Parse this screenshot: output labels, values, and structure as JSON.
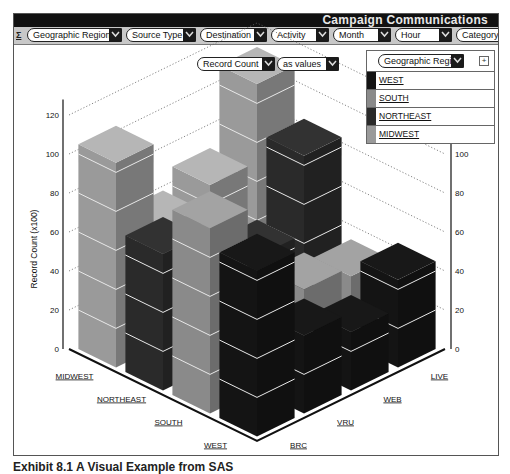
{
  "window": {
    "title": "Campaign Communications"
  },
  "toolbar": {
    "icon": "table-icon",
    "filters": [
      {
        "label": "Geographic Region"
      },
      {
        "label": "Source Type"
      },
      {
        "label": "Destination"
      },
      {
        "label": "Activity"
      },
      {
        "label": "Month"
      },
      {
        "label": "Hour"
      },
      {
        "label": "Category Desc"
      }
    ]
  },
  "measure_controls": {
    "measure": "Record Count",
    "mode": "as values"
  },
  "legend": {
    "header": "Geographic Region",
    "add_button": "+",
    "items": [
      {
        "label": "WEST",
        "color": "#141414"
      },
      {
        "label": "SOUTH",
        "color": "#8a8a8a"
      },
      {
        "label": "NORTHEAST",
        "color": "#2a2a2a"
      },
      {
        "label": "MIDWEST",
        "color": "#9a9a9a"
      }
    ]
  },
  "caption": "Exhibit 8.1  A Visual Example from SAS",
  "chart_data": {
    "type": "bar",
    "subtype": "3d-grouped",
    "title": "Campaign Communications",
    "ylabel": "Record Count (x100)",
    "xlabel": "Geographic Region",
    "zlabel": "Source Type",
    "ylim": [
      0,
      120
    ],
    "yticks": [
      0,
      20,
      40,
      60,
      80,
      100,
      120
    ],
    "grid": true,
    "legend_position": "top-right",
    "regions": [
      "MIDWEST",
      "NORTHEAST",
      "SOUTH",
      "WEST"
    ],
    "source_types": [
      "BRC",
      "VRU",
      "WEB",
      "LIVE"
    ],
    "series": [
      {
        "name": "MIDWEST",
        "color": "#9a9a9a",
        "values": [
          105,
          60,
          70,
          110
        ]
      },
      {
        "name": "NORTHEAST",
        "color": "#2a2a2a",
        "values": [
          70,
          45,
          45,
          85
        ]
      },
      {
        "name": "SOUTH",
        "color": "#8a8a8a",
        "values": [
          95,
          35,
          40,
          35
        ]
      },
      {
        "name": "WEST",
        "color": "#141414",
        "values": [
          85,
          40,
          30,
          45
        ]
      }
    ]
  }
}
